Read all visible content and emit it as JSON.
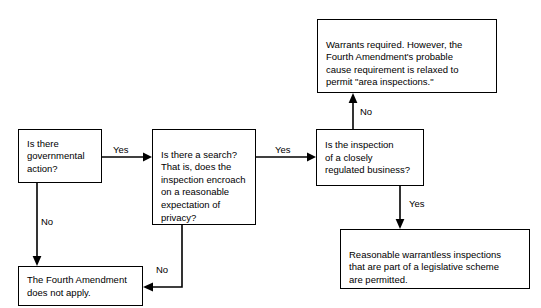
{
  "diagram": {
    "type": "flowchart",
    "background_color": "#ffffff",
    "line_color": "#000000",
    "text_color": "#000000",
    "nodes": [
      {
        "id": "governmental-action",
        "label": "Is there\ngovernmental\naction?",
        "shape": "rectangle",
        "x": 18,
        "y": 129,
        "width": 84,
        "height": 54
      },
      {
        "id": "is-there-a-search",
        "label": "Is there a search?\nThat is, does the\ninspection encroach\non a reasonable\nexpectation of\nprivacy?",
        "shape": "rectangle",
        "x": 152,
        "y": 129,
        "width": 104,
        "height": 96
      },
      {
        "id": "closely-regulated-business",
        "label": "Is the inspection\nof a closely\nregulated business?",
        "shape": "rectangle",
        "x": 316,
        "y": 129,
        "width": 108,
        "height": 57
      },
      {
        "id": "warrants-required",
        "label": "Warrants required.  However, the\nFourth Amendment's probable\ncause requirement is relaxed to\npermit \"area inspections.\"",
        "shape": "rectangle",
        "x": 317,
        "y": 19,
        "width": 180,
        "height": 74
      },
      {
        "id": "warrantless-permitted",
        "label": "Reasonable warrantless inspections\nthat are part of a legislative scheme\nare permitted.",
        "shape": "rectangle",
        "x": 340,
        "y": 229,
        "width": 190,
        "height": 60
      },
      {
        "id": "does-not-apply",
        "label": "The Fourth Amendment\ndoes not apply.",
        "shape": "rectangle",
        "x": 18,
        "y": 266,
        "width": 125,
        "height": 40
      }
    ],
    "edges": [
      {
        "id": "gov-to-search",
        "from": "governmental-action",
        "to": "is-there-a-search",
        "label": "Yes",
        "label_x": 113,
        "label_y": 144
      },
      {
        "id": "gov-to-noapply",
        "from": "governmental-action",
        "to": "does-not-apply",
        "label": "No",
        "label_x": 41,
        "label_y": 216
      },
      {
        "id": "search-to-business",
        "from": "is-there-a-search",
        "to": "closely-regulated-business",
        "label": "Yes",
        "label_x": 275,
        "label_y": 144
      },
      {
        "id": "search-to-noapply",
        "from": "is-there-a-search",
        "to": "does-not-apply",
        "label": "No",
        "label_x": 156,
        "label_y": 264
      },
      {
        "id": "business-to-warrants",
        "from": "closely-regulated-business",
        "to": "warrants-required",
        "label": "No",
        "label_x": 360,
        "label_y": 106
      },
      {
        "id": "business-to-permitted",
        "from": "closely-regulated-business",
        "to": "warrantless-permitted",
        "label": "Yes",
        "label_x": 409,
        "label_y": 198
      }
    ]
  }
}
